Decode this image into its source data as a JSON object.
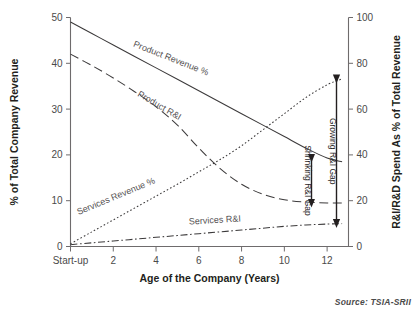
{
  "source_note": "Source: TSIA-SRII",
  "chart_data": {
    "type": "line",
    "title": "",
    "xlabel": "Age of the Company (Years)",
    "ylabel": "% of Total Company Revenue",
    "y2label": "R&I/R&D Spend As % of Total Revenue",
    "grid": false,
    "legend": "inline-curve-labels",
    "xlim": [
      0,
      13
    ],
    "ylim": [
      0,
      50
    ],
    "y2lim": [
      0,
      100
    ],
    "xtick_labels": [
      "Start-up",
      "2",
      "4",
      "6",
      "8",
      "10",
      "12"
    ],
    "xtick_values": [
      0,
      2,
      4,
      6,
      8,
      10,
      12
    ],
    "ytick_labels": [
      "0",
      "10",
      "20",
      "30",
      "40",
      "50"
    ],
    "ytick_values": [
      0,
      10,
      20,
      30,
      40,
      50
    ],
    "y2tick_labels": [
      "0",
      "20",
      "40",
      "60",
      "80",
      "100"
    ],
    "y2tick_values": [
      0,
      20,
      40,
      60,
      80,
      100
    ],
    "x": [
      0,
      1,
      2,
      3,
      4,
      5,
      6,
      7,
      8,
      9,
      10,
      11,
      12,
      12.7
    ],
    "series": [
      {
        "name": "Product Revenue %",
        "label": "Product Revenue %",
        "axis": "left",
        "style": "solid",
        "values": [
          49.0,
          46.5,
          44.0,
          41.5,
          39.0,
          36.5,
          34.0,
          31.5,
          29.0,
          26.5,
          24.0,
          21.5,
          19.3,
          18.5
        ]
      },
      {
        "name": "Product R&I",
        "label": "Product R&I",
        "axis": "left",
        "style": "dashed",
        "values": [
          42.0,
          39.5,
          36.8,
          33.8,
          30.5,
          26.5,
          21.5,
          17.0,
          13.6,
          11.4,
          10.2,
          9.7,
          9.5,
          9.5
        ]
      },
      {
        "name": "Services Revenue %",
        "label": "Services Revenue %",
        "axis": "left",
        "style": "dotted",
        "values": [
          0.6,
          3.2,
          5.8,
          8.4,
          11.0,
          13.6,
          16.3,
          19.0,
          22.0,
          25.5,
          29.0,
          32.5,
          35.3,
          36.6
        ]
      },
      {
        "name": "Services R&I",
        "label": "Services R&I",
        "axis": "left",
        "style": "dashdot",
        "values": [
          0.4,
          0.8,
          1.2,
          1.6,
          2.0,
          2.4,
          2.8,
          3.2,
          3.6,
          4.0,
          4.4,
          4.7,
          4.9,
          5.0
        ]
      }
    ],
    "annotations": [
      {
        "name": "growing-gap",
        "label": "Growing R&I Gap",
        "from_series": "Services Revenue %",
        "to_series": "Services R&I",
        "at_x": 12.7,
        "from_value": 36.6,
        "to_value": 5.0
      },
      {
        "name": "shrinking-gap",
        "label": "Shrinking R&I Gap",
        "from_series": "Product Revenue %",
        "to_series": "Product R&I",
        "at_x": 12.0,
        "from_value": 19.3,
        "to_value": 9.5
      }
    ]
  }
}
